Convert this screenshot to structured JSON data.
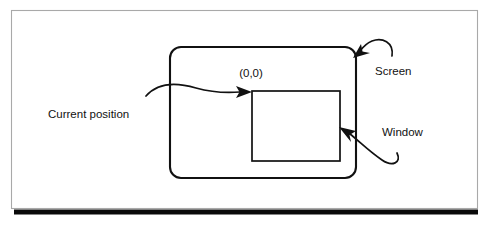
{
  "figure": {
    "type": "annotated-diagram",
    "background_color": "#ffffff",
    "line_color": "#111111",
    "frame_color": "#a9a9a9",
    "bottom_bar_color": "#0a0a0a"
  },
  "shapes": {
    "screen": {
      "name": "Screen",
      "shape": "rounded-rectangle",
      "x": 170,
      "y": 47,
      "width": 186,
      "height": 131,
      "radius": 11
    },
    "window": {
      "name": "Window",
      "shape": "rectangle",
      "x": 252,
      "y": 91,
      "width": 88,
      "height": 70
    }
  },
  "labels": {
    "origin": "(0,0)",
    "current_position": "Current position",
    "screen": "Screen",
    "window": "Window"
  },
  "annotations": [
    {
      "id": "current-position",
      "label": "Current position",
      "points_to": "window-origin-corner",
      "arrow_style": "s-curve-right"
    },
    {
      "id": "screen",
      "label": "Screen",
      "points_to": "screen-top-right-corner",
      "arrow_style": "hook-down-left"
    },
    {
      "id": "window",
      "label": "Window",
      "points_to": "window-right-edge",
      "arrow_style": "hook-up-left"
    }
  ]
}
